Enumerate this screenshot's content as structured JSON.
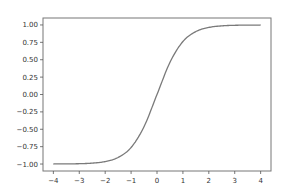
{
  "chart_data": {
    "type": "line",
    "title": "",
    "xlabel": "",
    "ylabel": "",
    "xlim": [
      -4.4,
      4.4
    ],
    "ylim": [
      -1.1,
      1.1
    ],
    "grid": false,
    "legend": null,
    "x_ticks": [
      -4,
      -3,
      -2,
      -1,
      0,
      1,
      2,
      3,
      4
    ],
    "x_tick_labels": [
      "−4",
      "−3",
      "−2",
      "−1",
      "0",
      "1",
      "2",
      "3",
      "4"
    ],
    "y_ticks": [
      -1.0,
      -0.75,
      -0.5,
      -0.25,
      0.0,
      0.25,
      0.5,
      0.75,
      1.0
    ],
    "y_tick_labels": [
      "−1.00",
      "−0.75",
      "−0.50",
      "−0.25",
      "0.00",
      "0.25",
      "0.50",
      "0.75",
      "1.00"
    ],
    "series": [
      {
        "name": "tanh(x)",
        "color": "#7a7a7a",
        "x": [
          -4,
          -3.5,
          -3,
          -2.5,
          -2,
          -1.5,
          -1,
          -0.5,
          0,
          0.5,
          1,
          1.5,
          2,
          2.5,
          3,
          3.5,
          4
        ],
        "y": [
          -0.999,
          -0.998,
          -0.995,
          -0.987,
          -0.964,
          -0.905,
          -0.762,
          -0.462,
          0.0,
          0.462,
          0.762,
          0.905,
          0.964,
          0.987,
          0.995,
          0.998,
          0.999
        ]
      }
    ]
  },
  "style": {
    "spine_color": "#777777",
    "tick_color": "#555555",
    "background": "#ffffff"
  }
}
